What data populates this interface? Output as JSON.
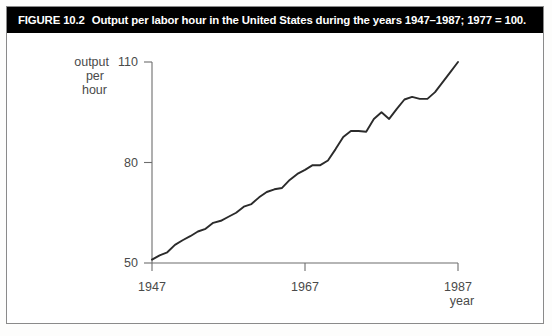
{
  "caption": {
    "figure_number": "FIGURE 10.2",
    "text": "Output per labor hour in the United States during the years 1947–1987; 1977 = 100.",
    "background_color": "#000000",
    "text_color": "#ffffff"
  },
  "axes": {
    "y_label_line1": "output",
    "y_label_line2": "per",
    "y_label_line3": "hour",
    "y_ticks": [
      "110",
      "80",
      "50"
    ],
    "x_ticks": [
      "1947",
      "1967",
      "1987"
    ],
    "x_label": "year"
  },
  "chart_data": {
    "type": "line",
    "title": "Output per labor hour in the United States during the years 1947–1987; 1977 = 100.",
    "xlabel": "year",
    "ylabel": "output per hour",
    "xlim": [
      1947,
      1987
    ],
    "ylim": [
      50,
      110
    ],
    "xticks": [
      1947,
      1967,
      1987
    ],
    "yticks": [
      50,
      80,
      110
    ],
    "grid": false,
    "legend": false,
    "line_color": "#2b2b2b",
    "x": [
      1947,
      1948,
      1949,
      1950,
      1951,
      1952,
      1953,
      1954,
      1955,
      1956,
      1957,
      1958,
      1959,
      1960,
      1961,
      1962,
      1963,
      1964,
      1965,
      1966,
      1967,
      1968,
      1969,
      1970,
      1971,
      1972,
      1973,
      1974,
      1975,
      1976,
      1977,
      1978,
      1979,
      1980,
      1981,
      1982,
      1983,
      1984,
      1985,
      1986,
      1987
    ],
    "values": [
      51.0,
      52.3,
      53.2,
      55.4,
      56.8,
      58.0,
      59.4,
      60.2,
      62.0,
      62.6,
      63.8,
      65.0,
      66.8,
      67.6,
      69.6,
      71.2,
      72.0,
      72.4,
      74.8,
      76.6,
      77.8,
      79.2,
      79.2,
      80.6,
      84.0,
      87.6,
      89.4,
      89.4,
      89.2,
      93.0,
      95.0,
      93.0,
      96.0,
      98.8,
      99.6,
      99.0,
      99.0,
      101.0,
      104.0,
      107.0,
      110.0
    ]
  }
}
